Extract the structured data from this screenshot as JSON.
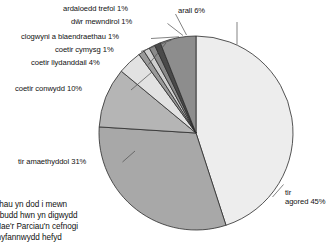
{
  "chart_data": {
    "type": "pie",
    "title": "",
    "xlabel": "",
    "ylabel": "",
    "legend_position": "none",
    "grid": false,
    "start_angle_deg": 0,
    "direction": "clockwise",
    "categories": [
      "tir agored",
      "tir amaethyddol",
      "coetir conwydd",
      "coetir llydanddail",
      "coetir cymysg",
      "clogwyni a blaendraethau",
      "dŵr mewndirol",
      "ardaloedd trefol",
      "arall"
    ],
    "values": [
      45,
      31,
      10,
      4,
      1,
      1,
      1,
      1,
      6
    ],
    "units": "%",
    "colors": [
      "#ededed",
      "#a8a8a8",
      "#b5b5b5",
      "#e2e2e2",
      "#9a9a9a",
      "#cfcfcf",
      "#8a8a8a",
      "#4a4a4a",
      "#8d8d8d"
    ],
    "slice_labels": [
      "tir\nagored 45%",
      "tir amaethyddol 31%",
      "coetir conwydd 10%",
      "coetir llydanddail 4%",
      "coetir cymysg 1%",
      "clogwyni a blaendraethau 1%",
      "dŵr mewndirol 1%",
      "ardaloedd trefol 1%",
      "arall 6%"
    ]
  },
  "labels": {
    "ardaloedd_trefol": "ardaloedd trefol 1%",
    "dwr_mewndirol": "dŵr mewndirol 1%",
    "clogwyni": "clogwyni a blaendraethau 1%",
    "coetir_cymysg": "coetir cymysg 1%",
    "coetir_llydanddail": "coetir llydanddail 4%",
    "coetir_conwydd": "coetir conwydd 10%",
    "tir_amaethyddol": "tir amaethyddol 31%",
    "arall": "arall 6%",
    "tir_agored_line1": "tir",
    "tir_agored_line2": "agored 45%"
  },
  "body_text": {
    "line1": "aethau yn dod i mewn",
    "line2": "r o'r budd hwn yn digwydd",
    "line3": "l. Mae'r Parciau'n cefnogi",
    "line4": "ei chyfannwydd hefyd"
  }
}
